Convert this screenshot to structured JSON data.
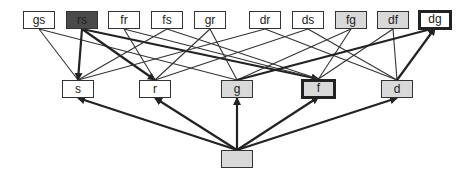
{
  "diagram": {
    "type": "lattice",
    "colors": {
      "edge": "#333333",
      "gray_fill": "#d9d9d9",
      "dark_fill": "#4a4a4a",
      "border": "#333333"
    },
    "nodes": [
      {
        "id": "gs",
        "label": "gs",
        "x": 23,
        "y": 11,
        "w": 32,
        "style": "plain"
      },
      {
        "id": "rs",
        "label": "rs",
        "x": 66,
        "y": 11,
        "w": 32,
        "style": "dark"
      },
      {
        "id": "fr",
        "label": "fr",
        "x": 108,
        "y": 11,
        "w": 32,
        "style": "plain"
      },
      {
        "id": "fs",
        "label": "fs",
        "x": 151,
        "y": 11,
        "w": 32,
        "style": "plain"
      },
      {
        "id": "gr",
        "label": "gr",
        "x": 194,
        "y": 11,
        "w": 32,
        "style": "plain"
      },
      {
        "id": "dr",
        "label": "dr",
        "x": 249,
        "y": 11,
        "w": 32,
        "style": "plain"
      },
      {
        "id": "ds",
        "label": "ds",
        "x": 292,
        "y": 11,
        "w": 32,
        "style": "plain"
      },
      {
        "id": "fg",
        "label": "fg",
        "x": 335,
        "y": 11,
        "w": 32,
        "style": "gray"
      },
      {
        "id": "df",
        "label": "df",
        "x": 377,
        "y": 11,
        "w": 32,
        "style": "gray"
      },
      {
        "id": "dg",
        "label": "dg",
        "x": 418,
        "y": 10,
        "w": 34,
        "style": "thick"
      },
      {
        "id": "s",
        "label": "s",
        "x": 62,
        "y": 80,
        "w": 32,
        "style": "plain"
      },
      {
        "id": "r",
        "label": "r",
        "x": 139,
        "y": 80,
        "w": 32,
        "style": "plain"
      },
      {
        "id": "g",
        "label": "g",
        "x": 221,
        "y": 80,
        "w": 32,
        "style": "gray"
      },
      {
        "id": "f",
        "label": "f",
        "x": 301,
        "y": 79,
        "w": 35,
        "style": "thick-gray"
      },
      {
        "id": "d",
        "label": "d",
        "x": 381,
        "y": 80,
        "w": 32,
        "style": "gray"
      },
      {
        "id": "bottom",
        "label": "",
        "x": 221,
        "y": 150,
        "w": 32,
        "style": "gray"
      }
    ],
    "edges": [
      {
        "from": "gs",
        "to": "s",
        "arrow": false,
        "thick": false
      },
      {
        "from": "gs",
        "to": "g",
        "arrow": false,
        "thick": false
      },
      {
        "from": "rs",
        "to": "s",
        "arrow": true,
        "thick": true
      },
      {
        "from": "rs",
        "to": "r",
        "arrow": true,
        "thick": true
      },
      {
        "from": "rs",
        "to": "f",
        "arrow": true,
        "thick": true
      },
      {
        "from": "fr",
        "to": "r",
        "arrow": false,
        "thick": false
      },
      {
        "from": "fr",
        "to": "f",
        "arrow": false,
        "thick": false
      },
      {
        "from": "fs",
        "to": "s",
        "arrow": false,
        "thick": false
      },
      {
        "from": "fs",
        "to": "f",
        "arrow": false,
        "thick": false
      },
      {
        "from": "gr",
        "to": "r",
        "arrow": false,
        "thick": false
      },
      {
        "from": "gr",
        "to": "g",
        "arrow": false,
        "thick": false
      },
      {
        "from": "dr",
        "to": "s",
        "arrow": false,
        "thick": false
      },
      {
        "from": "dr",
        "to": "d",
        "arrow": false,
        "thick": false
      },
      {
        "from": "ds",
        "to": "r",
        "arrow": false,
        "thick": false
      },
      {
        "from": "ds",
        "to": "d",
        "arrow": false,
        "thick": false
      },
      {
        "from": "fg",
        "to": "f",
        "arrow": false,
        "thick": false
      },
      {
        "from": "fg",
        "to": "g",
        "arrow": false,
        "thick": false
      },
      {
        "from": "df",
        "to": "f",
        "arrow": false,
        "thick": false
      },
      {
        "from": "df",
        "to": "d",
        "arrow": false,
        "thick": false
      },
      {
        "from": "g",
        "to": "dg",
        "arrow": true,
        "thick": true
      },
      {
        "from": "d",
        "to": "dg",
        "arrow": true,
        "thick": true
      },
      {
        "from": "bottom",
        "to": "s",
        "arrow": true,
        "thick": true
      },
      {
        "from": "bottom",
        "to": "r",
        "arrow": true,
        "thick": true
      },
      {
        "from": "bottom",
        "to": "g",
        "arrow": true,
        "thick": true
      },
      {
        "from": "bottom",
        "to": "f",
        "arrow": true,
        "thick": true
      },
      {
        "from": "bottom",
        "to": "d",
        "arrow": true,
        "thick": true
      }
    ]
  }
}
